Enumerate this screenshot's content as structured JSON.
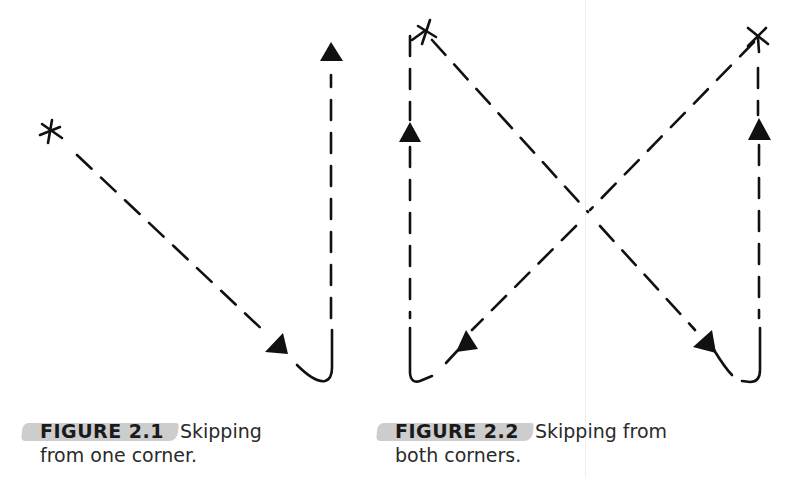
{
  "figures": [
    {
      "id": "2.1",
      "label": "FIGURE 2.1",
      "caption_line1": "Skipping",
      "caption_line2": "from one corner.",
      "description": "Dashed path starts at a star in the upper-left, runs diagonally down-right to the bottom corner, curves, then runs straight up with an arrow pointing up."
    },
    {
      "id": "2.2",
      "label": "FIGURE 2.2",
      "caption_line1": "Skipping from",
      "caption_line2": "both corners.",
      "description": "Two dashed diagonals from stars at the top-left and top-right corners cross at the center, reach opposite bottom corners, curve, and run up the side edges with upward arrows."
    }
  ],
  "colors": {
    "ink": "#111111",
    "caption_highlight": "#bcbcbc",
    "fold_line": "#ececec",
    "background": "#ffffff"
  }
}
